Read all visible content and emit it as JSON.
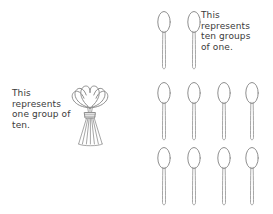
{
  "page": {
    "width": 273,
    "height": 214,
    "background_color": "#ffffff",
    "stroke_color": "#8f8f8f",
    "text_color": "#3a3a3a"
  },
  "captions": {
    "left": {
      "text": "This\nrepresents\none group of\nten.",
      "lines": [
        "This",
        "represents",
        "one group of",
        "ten."
      ]
    },
    "right": {
      "text": "This\nrepresents\nten groups\nof one.",
      "lines": [
        "This",
        "represents",
        "ten groups",
        "of one."
      ]
    }
  },
  "bundle": {
    "label": "bundle-of-ten-spoons",
    "count": 10,
    "x": 70,
    "y": 82,
    "width": 40,
    "height": 66
  },
  "loose_spoons": {
    "label": "ten-loose-spoons",
    "total": 10,
    "rows": [
      {
        "index": 0,
        "count": 2,
        "y": 10,
        "xs": [
          155,
          185
        ]
      },
      {
        "index": 1,
        "count": 4,
        "y": 81,
        "xs": [
          155,
          185,
          215,
          243
        ]
      },
      {
        "index": 2,
        "count": 3,
        "y": 146,
        "xs": [
          155,
          185,
          215
        ]
      },
      {
        "index": 3,
        "count": 1,
        "y": 146,
        "xs": [
          243
        ]
      }
    ],
    "spoon": {
      "width": 18,
      "height": 62,
      "bowl_rx": 6.2,
      "bowl_ry": 10.5
    }
  }
}
